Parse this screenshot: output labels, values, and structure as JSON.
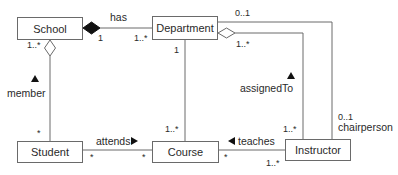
{
  "diagram": {
    "type": "UML class diagram",
    "classes": [
      {
        "id": "school",
        "name": "School"
      },
      {
        "id": "department",
        "name": "Department"
      },
      {
        "id": "student",
        "name": "Student"
      },
      {
        "id": "course",
        "name": "Course"
      },
      {
        "id": "instructor",
        "name": "Instructor"
      }
    ],
    "associations": {
      "has": {
        "label": "has",
        "kind": "composition",
        "from": "School",
        "to": "Department",
        "mult_from": "1",
        "mult_to": "1..*"
      },
      "member": {
        "label": "member",
        "kind": "aggregation",
        "from": "School",
        "to": "Student",
        "mult_from": "1..*",
        "mult_to": "*",
        "direction_arrow": "up"
      },
      "dept_course": {
        "label": "",
        "kind": "association",
        "from": "Department",
        "to": "Course",
        "mult_from": "1",
        "mult_to": "1..*"
      },
      "assignedTo": {
        "label": "assignedTo",
        "kind": "aggregation",
        "from": "Department",
        "to": "Instructor",
        "mult_from": "1..*",
        "mult_to": "1..*",
        "direction_arrow": "up"
      },
      "chairperson": {
        "label": "chairperson",
        "kind": "association",
        "from": "Department",
        "to": "Instructor",
        "mult_from": "0..1",
        "mult_to": "0..1"
      },
      "attends": {
        "label": "attends",
        "kind": "association",
        "from": "Student",
        "to": "Course",
        "mult_from": "*",
        "mult_to": "*",
        "direction_arrow": "right"
      },
      "teaches": {
        "label": "teaches",
        "kind": "association",
        "from": "Instructor",
        "to": "Course",
        "mult_from": "1..*",
        "mult_to": "*",
        "direction_arrow": "left"
      }
    }
  }
}
